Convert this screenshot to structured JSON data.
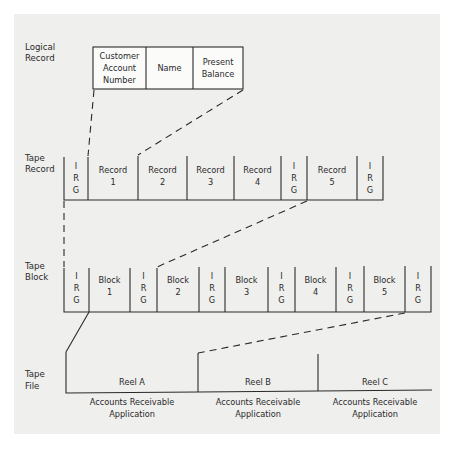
{
  "colors": {
    "page": "#ffffff",
    "paper": "#efefed",
    "ink": "#2a2a2a"
  },
  "row_labels": {
    "logical_record": [
      "Logical",
      "Record"
    ],
    "tape_record": [
      "Tape",
      "Record"
    ],
    "tape_block": [
      "Tape",
      "Block"
    ],
    "tape_file": [
      "Tape",
      "File"
    ]
  },
  "logical_record": {
    "fields": [
      {
        "lines": [
          "Customer",
          "Account",
          "Number"
        ]
      },
      {
        "lines": [
          "Name"
        ]
      },
      {
        "lines": [
          "Present",
          "Balance"
        ]
      }
    ]
  },
  "tape_record": {
    "cells": [
      {
        "type": "gap",
        "lines": [
          "I",
          "R",
          "G"
        ]
      },
      {
        "type": "record",
        "lines": [
          "Record",
          "1"
        ]
      },
      {
        "type": "record",
        "lines": [
          "Record",
          "2"
        ]
      },
      {
        "type": "record",
        "lines": [
          "Record",
          "3"
        ]
      },
      {
        "type": "record",
        "lines": [
          "Record",
          "4"
        ]
      },
      {
        "type": "gap",
        "lines": [
          "I",
          "R",
          "G"
        ]
      },
      {
        "type": "record",
        "lines": [
          "Record",
          "5"
        ]
      },
      {
        "type": "gap",
        "lines": [
          "I",
          "R",
          "G"
        ]
      }
    ]
  },
  "tape_block": {
    "cells": [
      {
        "type": "gap",
        "lines": [
          "I",
          "R",
          "G"
        ]
      },
      {
        "type": "block",
        "lines": [
          "Block",
          "1"
        ]
      },
      {
        "type": "gap",
        "lines": [
          "I",
          "R",
          "G"
        ]
      },
      {
        "type": "block",
        "lines": [
          "Block",
          "2"
        ]
      },
      {
        "type": "gap",
        "lines": [
          "I",
          "R",
          "G"
        ]
      },
      {
        "type": "block",
        "lines": [
          "Block",
          "3"
        ]
      },
      {
        "type": "gap",
        "lines": [
          "I",
          "R",
          "G"
        ]
      },
      {
        "type": "block",
        "lines": [
          "Block",
          "4"
        ]
      },
      {
        "type": "gap",
        "lines": [
          "I",
          "R",
          "G"
        ]
      },
      {
        "type": "block",
        "lines": [
          "Block",
          "5"
        ]
      },
      {
        "type": "gap",
        "lines": [
          "I",
          "R",
          "G"
        ]
      }
    ]
  },
  "tape_file": {
    "reels": [
      {
        "label": "Reel A",
        "caption": [
          "Accounts Receivable",
          "Application"
        ]
      },
      {
        "label": "Reel B",
        "caption": [
          "Accounts Receivable",
          "Application"
        ]
      },
      {
        "label": "Reel C",
        "caption": [
          "Accounts Receivable",
          "Application"
        ]
      }
    ]
  }
}
